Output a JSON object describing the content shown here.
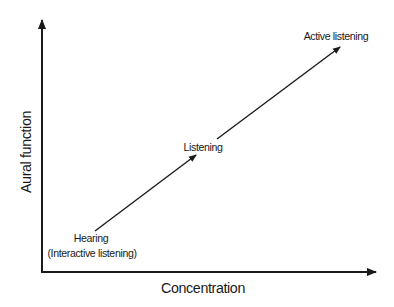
{
  "diagram": {
    "x_axis": {
      "label": "Concentration"
    },
    "y_axis": {
      "label": "Aural function"
    },
    "stages": [
      {
        "label": "Hearing",
        "sublabel": "(Interactive listening)"
      },
      {
        "label": "Listening"
      },
      {
        "label": "Active listening"
      }
    ],
    "colors": {
      "line": "#1a1a1a",
      "background": "#ffffff",
      "text": "#1a1a1a"
    }
  }
}
